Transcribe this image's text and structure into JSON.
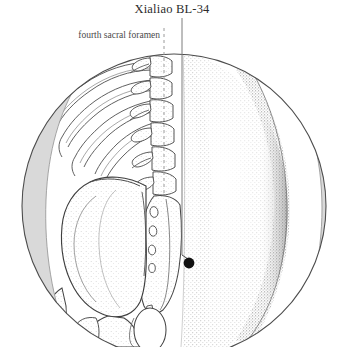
{
  "figure": {
    "title": "Xialiao BL-34",
    "point_code": "BL-34",
    "point_name": "Xialiao",
    "region": "sacrum / lower back",
    "view": "posterior"
  },
  "labels": [
    {
      "id": "fourth-sacral-foramen",
      "text": "fourth sacral foramen",
      "leader_style": "dashed",
      "leader_color": "#9a9a9a"
    }
  ],
  "annotations": {
    "title_leader_style": "solid",
    "title_leader_color": "#7d7d7d",
    "acupoint_marker": {
      "shape": "filled-circle",
      "color": "#111111",
      "x": 189,
      "y": 263,
      "radius": 5.4
    }
  },
  "colors": {
    "background": "#ffffff",
    "outline": "#3c3c3c",
    "bone_outline": "#434343",
    "soft_tissue_stipple": "#6d6d6d",
    "silhouette_grey": "#d9d9d9",
    "silhouette_grey_edge": "#9b9b9b",
    "title_text": "#2b2b2b",
    "label_text": "#4a4a4a",
    "marker": "#111111"
  },
  "geometry": {
    "circle_center_x": 174,
    "circle_center_y": 206,
    "circle_radius": 152,
    "dashed_leader_x": 164,
    "solid_leader_x": 182,
    "midline_x": 182
  },
  "anatomy": {
    "structures": [
      "ribs",
      "lumbar vertebrae",
      "spinous processes",
      "sacrum",
      "sacral foramina",
      "ilium",
      "iliac crest",
      "ischium",
      "greater trochanter",
      "gluteal soft tissue"
    ]
  }
}
